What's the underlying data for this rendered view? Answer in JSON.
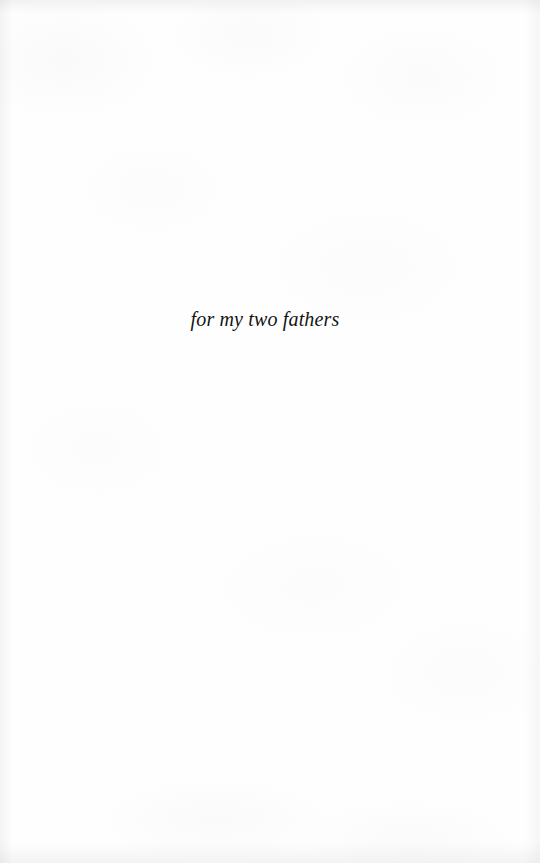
{
  "page": {
    "kind": "book-dedication-page",
    "background_color": "#fefefe",
    "ink_color": "#141414"
  },
  "dedication": {
    "text": "for my two fathers"
  }
}
